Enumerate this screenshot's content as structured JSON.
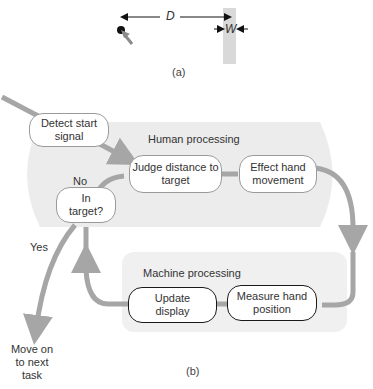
{
  "panel_a": {
    "distance_label": "D",
    "width_label": "W",
    "caption": "(a)"
  },
  "panel_b": {
    "caption": "(b)",
    "regions": {
      "human": "Human processing",
      "machine": "Machine processing"
    },
    "nodes": {
      "detect": "Detect start signal",
      "judge": "Judge distance to target",
      "effect": "Effect hand movement",
      "in_target": "In target?",
      "measure": "Measure hand position",
      "update": "Update display"
    },
    "branch_labels": {
      "no": "No",
      "yes": "Yes"
    },
    "terminal": "Move on to next task"
  },
  "colors": {
    "arrow": "#a6a6a6",
    "region_fill": "#ececec",
    "target_bar": "#d9d9d9",
    "human_box_border": "#9a9a9a",
    "machine_box_border": "#1a1a1a"
  }
}
